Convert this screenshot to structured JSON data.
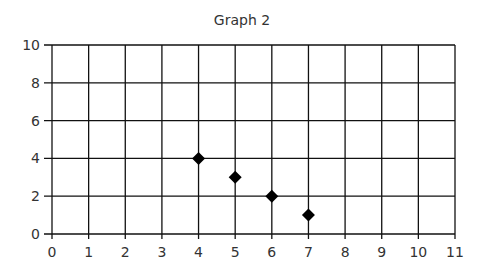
{
  "chart_data": {
    "type": "scatter",
    "title": "Graph 2",
    "xlabel": "",
    "ylabel": "",
    "xlim": [
      0,
      11
    ],
    "ylim": [
      0,
      10
    ],
    "x_ticks": [
      0,
      1,
      2,
      3,
      4,
      5,
      6,
      7,
      8,
      9,
      10,
      11
    ],
    "y_ticks": [
      0,
      2,
      4,
      6,
      8,
      10
    ],
    "grid": true,
    "marker": "diamond",
    "series": [
      {
        "name": "",
        "points": [
          {
            "x": 4,
            "y": 4
          },
          {
            "x": 5,
            "y": 3
          },
          {
            "x": 6,
            "y": 2
          },
          {
            "x": 7,
            "y": 1
          }
        ]
      }
    ]
  }
}
